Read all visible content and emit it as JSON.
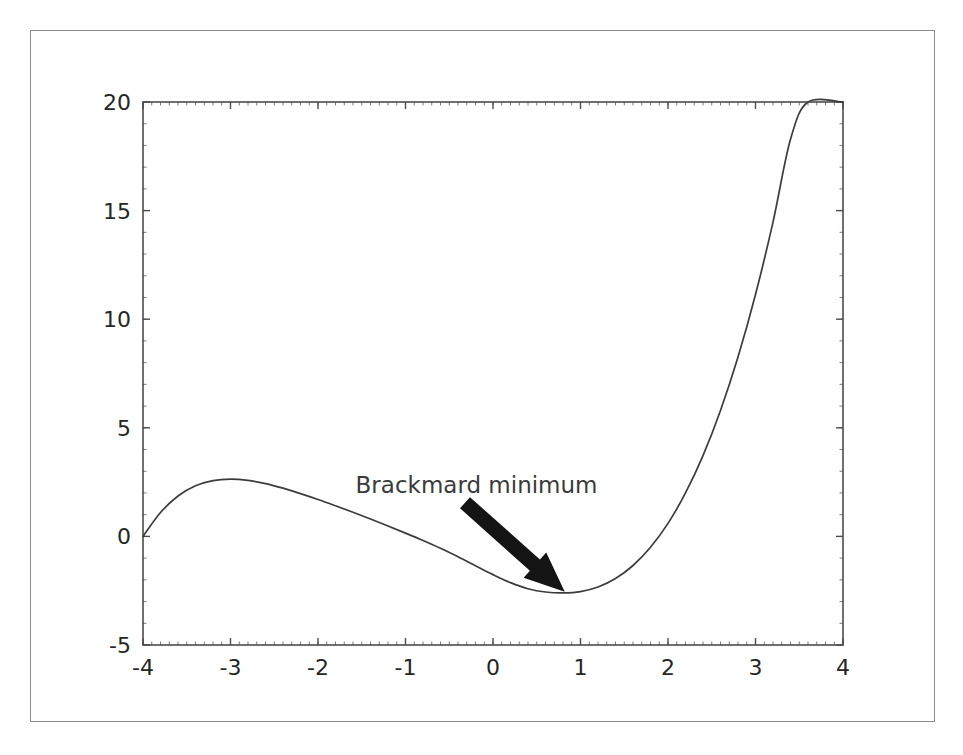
{
  "figure": {
    "background_color": "#ffffff",
    "border_color": "#8b8b8b",
    "axis_color": "#4d4d4d",
    "curve_color": "#3c3c3c",
    "arrow_color": "#141414",
    "text_color": "#262626"
  },
  "chart_data": {
    "type": "line",
    "title": "",
    "xlabel": "",
    "ylabel": "",
    "xlim": [
      -4,
      4
    ],
    "ylim": [
      -5,
      20
    ],
    "grid": false,
    "legend": null,
    "xticks": [
      -4,
      -3,
      -2,
      -1,
      0,
      1,
      2,
      3,
      4
    ],
    "xticklabels": [
      "-4",
      "-3",
      "-2",
      "-1",
      "0",
      "1",
      "2",
      "3",
      "4"
    ],
    "yticks": [
      -5,
      0,
      5,
      10,
      15,
      20
    ],
    "yticklabels": [
      "-5",
      "0",
      "5",
      "10",
      "15",
      "20"
    ],
    "minor_ticks": true,
    "series": [
      {
        "name": "f(x)",
        "x": [
          -4.0,
          -3.8,
          -3.6,
          -3.4,
          -3.2,
          -3.0,
          -2.8,
          -2.6,
          -2.4,
          -2.2,
          -2.0,
          -1.8,
          -1.6,
          -1.4,
          -1.2,
          -1.0,
          -0.8,
          -0.6,
          -0.4,
          -0.2,
          0.0,
          0.2,
          0.4,
          0.6,
          0.8,
          1.0,
          1.2,
          1.4,
          1.6,
          1.8,
          2.0,
          2.2,
          2.4,
          2.6,
          2.8,
          3.0,
          3.2,
          3.4,
          3.6,
          3.8,
          4.0
        ],
        "y": [
          0.0,
          1.1,
          1.86,
          2.33,
          2.57,
          2.64,
          2.58,
          2.43,
          2.22,
          1.97,
          1.7,
          1.41,
          1.11,
          0.8,
          0.48,
          0.15,
          -0.19,
          -0.55,
          -0.94,
          -1.35,
          -1.76,
          -2.13,
          -2.41,
          -2.56,
          -2.6,
          -2.54,
          -2.33,
          -1.94,
          -1.34,
          -0.5,
          0.6,
          2.0,
          3.72,
          5.8,
          8.26,
          11.14,
          14.47,
          18.28,
          22.61,
          27.49,
          20.0
        ]
      }
    ],
    "annotations": [
      {
        "name": "brackmard-minimum",
        "text": "Brackmard minimum",
        "text_x": -1.57,
        "text_y": 2.0,
        "arrow_tail_x": -0.32,
        "arrow_tail_y": 1.55,
        "arrow_tip_x": 0.82,
        "arrow_tip_y": -2.55
      }
    ]
  }
}
